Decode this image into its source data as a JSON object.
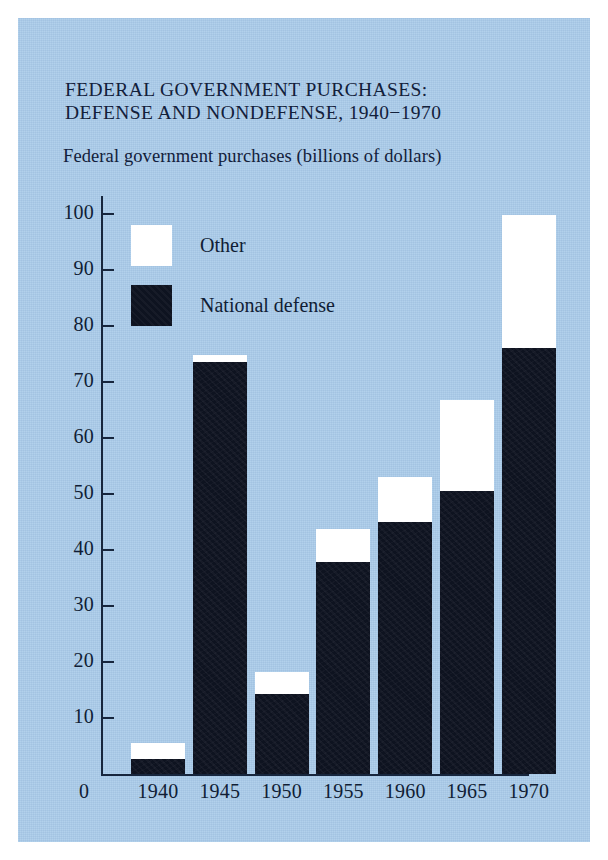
{
  "figure": {
    "title": "FEDERAL GOVERNMENT PURCHASES:\nDEFENSE AND NONDEFENSE, 1940−1970",
    "subtitle": "Federal government purchases (billions of dollars)",
    "origin_label": "0",
    "background_color": "#a9cbea",
    "ink_color": "#101d35"
  },
  "chart_data": {
    "type": "bar",
    "stacked": true,
    "title": "FEDERAL GOVERNMENT PURCHASES: DEFENSE AND NONDEFENSE, 1940−1970",
    "subtitle": "Federal government purchases (billions of dollars)",
    "xlabel": "",
    "ylabel": "Federal government purchases (billions of dollars)",
    "ylim": [
      0,
      100
    ],
    "yticks": [
      10,
      20,
      30,
      40,
      50,
      60,
      70,
      80,
      90,
      100
    ],
    "ytick_labels": [
      "10",
      "20",
      "30",
      "40",
      "50",
      "60",
      "70",
      "80",
      "90",
      "100"
    ],
    "grid": false,
    "legend_position": "upper-left-inside",
    "categories": [
      "1940",
      "1945",
      "1950",
      "1955",
      "1960",
      "1965",
      "1970"
    ],
    "series": [
      {
        "name": "National defense",
        "color": "#0e1320",
        "values": [
          2.7,
          73.6,
          14.3,
          37.8,
          45.0,
          50.6,
          76.0
        ]
      },
      {
        "name": "Other",
        "color": "#ffffff",
        "values": [
          2.8,
          1.2,
          4.0,
          6.0,
          8.0,
          16.2,
          23.8
        ]
      }
    ],
    "totals": [
      5.5,
      74.8,
      18.3,
      43.8,
      53.0,
      66.8,
      99.8
    ]
  },
  "legend": {
    "items": [
      {
        "label": "Other",
        "swatch": "white"
      },
      {
        "label": "National defense",
        "swatch": "black"
      }
    ]
  }
}
